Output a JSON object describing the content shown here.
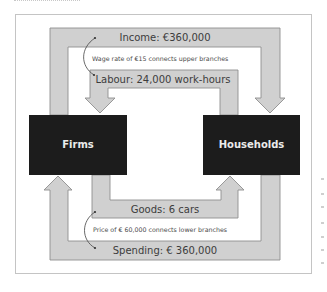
{
  "diagram": {
    "type": "circular-flow",
    "nodes": {
      "firms": {
        "label": "Firms"
      },
      "households": {
        "label": "Households"
      }
    },
    "flows": {
      "income": {
        "label": "Income: €360,000",
        "from": "Firms",
        "to": "Households"
      },
      "labour": {
        "label": "Labour: 24,000 work-hours",
        "from": "Households",
        "to": "Firms"
      },
      "goods": {
        "label": "Goods: 6 cars",
        "from": "Firms",
        "to": "Households"
      },
      "spending": {
        "label": "Spending: € 360,000",
        "from": "Households",
        "to": "Firms"
      }
    },
    "notes": {
      "upper": "Wage rate of €15 connects upper branches",
      "lower": "Price of € 60,000 connects lower branches"
    },
    "colors": {
      "flow_fill": "#d0d0d0",
      "flow_stroke": "#8e8e8e",
      "box_fill": "#1c1c1c",
      "box_text": "#ebebeb",
      "text": "#3c3c3c"
    }
  }
}
